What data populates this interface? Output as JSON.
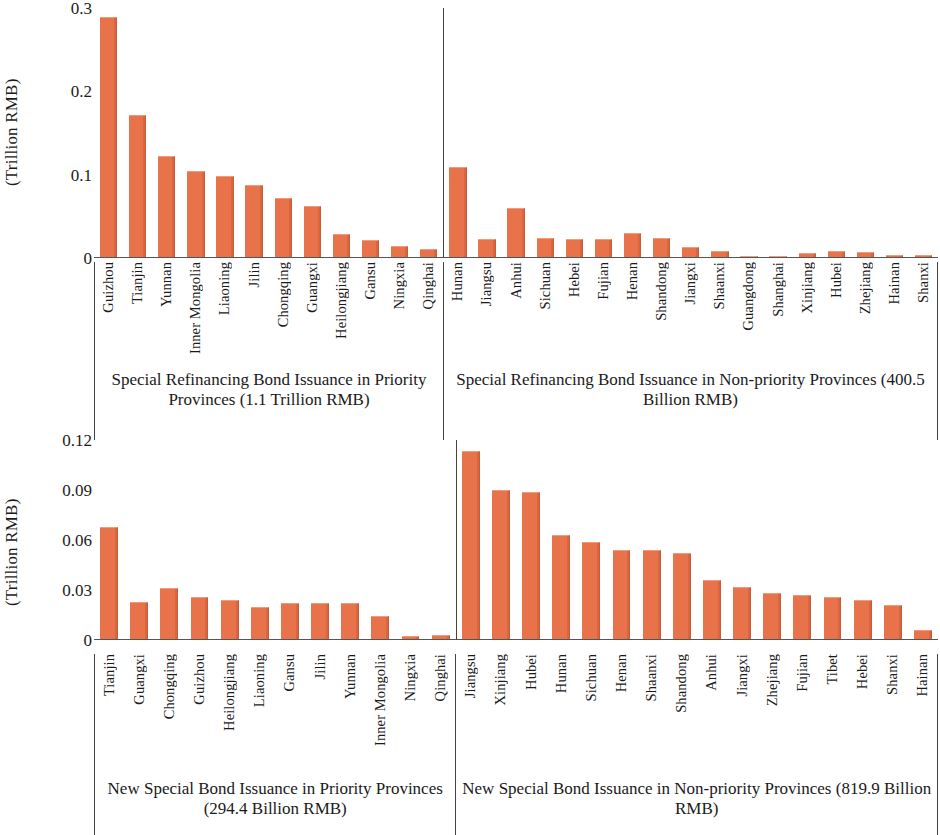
{
  "axis": {
    "y_label": "(Trillion RMB)",
    "top_ticks": [
      "0.3",
      "0.2",
      "0.1",
      "0"
    ],
    "bottom_ticks": [
      "0.12",
      "0.09",
      "0.06",
      "0.03",
      "0"
    ]
  },
  "colors": {
    "bar": "#e8734a",
    "bar_highlight": "#f09b7c",
    "bar_shadow": "#c95c38",
    "axis": "#555555",
    "text": "#1a1a1a"
  },
  "captions": {
    "top_left": "Special Refinancing Bond Issuance in Priority Provinces (1.1 Trillion RMB)",
    "top_right": "Special Refinancing Bond Issuance in Non-priority Provinces (400.5 Billion RMB)",
    "bottom_left": "New Special Bond Issuance in Priority Provinces (294.4 Billion RMB)",
    "bottom_right": "New Special Bond Issuance in Non-priority Provinces (819.9 Billion RMB)"
  },
  "chart_data": [
    {
      "type": "bar",
      "title": "Special Refinancing Bond Issuance in Priority Provinces (1.1 Trillion RMB)",
      "panel": "top-left",
      "ylabel": "(Trillion RMB)",
      "xlabel": "",
      "ylim": [
        0,
        0.3
      ],
      "yticks": [
        0,
        0.1,
        0.2,
        0.3
      ],
      "grid": false,
      "legend": "none",
      "categories": [
        "Guizhou",
        "Tianjin",
        "Yunnan",
        "Inner Mongolia",
        "Liaoning",
        "Jilin",
        "Chongqing",
        "Guangxi",
        "Heilongjiang",
        "Gansu",
        "Ningxia",
        "Qinghai"
      ],
      "values": [
        0.288,
        0.17,
        0.12,
        0.102,
        0.097,
        0.086,
        0.07,
        0.06,
        0.026,
        0.019,
        0.012,
        0.008
      ]
    },
    {
      "type": "bar",
      "title": "Special Refinancing Bond Issuance in Non-priority Provinces (400.5 Billion RMB)",
      "panel": "top-right",
      "ylabel": "(Trillion RMB)",
      "xlabel": "",
      "ylim": [
        0,
        0.3
      ],
      "yticks": [
        0,
        0.1,
        0.2,
        0.3
      ],
      "grid": false,
      "legend": "none",
      "categories": [
        "Hunan",
        "Jiangsu",
        "Anhui",
        "Sichuan",
        "Hebei",
        "Fujian",
        "Henan",
        "Shandong",
        "Jiangxi",
        "Shaanxi",
        "Guangdong",
        "Shanghai",
        "Xinjiang",
        "Hubei",
        "Zhejiang",
        "Hainan",
        "Shanxi"
      ],
      "values": [
        0.107,
        0.021,
        0.058,
        0.022,
        0.021,
        0.021,
        0.028,
        0.022,
        0.011,
        0.006,
        0.0,
        0.0,
        0.004,
        0.006,
        0.005,
        0.001,
        0.001
      ]
    },
    {
      "type": "bar",
      "title": "New Special Bond Issuance in Priority Provinces (294.4 Billion RMB)",
      "panel": "bottom-left",
      "ylabel": "(Trillion RMB)",
      "xlabel": "",
      "ylim": [
        0,
        0.12
      ],
      "yticks": [
        0,
        0.03,
        0.06,
        0.09,
        0.12
      ],
      "grid": false,
      "legend": "none",
      "categories": [
        "Tianjin",
        "Guangxi",
        "Chongqing",
        "Guizhou",
        "Heilongjiang",
        "Liaoning",
        "Gansu",
        "Jilin",
        "Yunnan",
        "Inner Mongolia",
        "Ningxia",
        "Qinghai"
      ],
      "values": [
        0.067,
        0.022,
        0.03,
        0.025,
        0.023,
        0.019,
        0.021,
        0.021,
        0.021,
        0.013,
        0.001,
        0.002
      ]
    },
    {
      "type": "bar",
      "title": "New Special Bond Issuance in Non-priority Provinces (819.9 Billion RMB)",
      "panel": "bottom-right",
      "ylabel": "(Trillion RMB)",
      "xlabel": "",
      "ylim": [
        0,
        0.12
      ],
      "yticks": [
        0,
        0.03,
        0.06,
        0.09,
        0.12
      ],
      "grid": false,
      "legend": "none",
      "categories": [
        "Jiangsu",
        "Xinjiang",
        "Hubei",
        "Hunan",
        "Sichuan",
        "Henan",
        "Shaanxi",
        "Shandong",
        "Anhui",
        "Jiangxi",
        "Zhejiang",
        "Fujian",
        "Tibet",
        "Hebei",
        "Shanxi",
        "Hainan"
      ],
      "values": [
        0.113,
        0.089,
        0.088,
        0.062,
        0.058,
        0.053,
        0.053,
        0.051,
        0.035,
        0.031,
        0.027,
        0.026,
        0.025,
        0.023,
        0.02,
        0.005
      ]
    }
  ]
}
